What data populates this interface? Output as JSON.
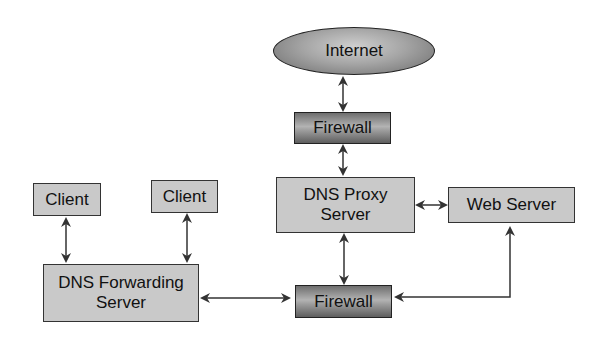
{
  "diagram": {
    "type": "network-topology",
    "nodes": {
      "internet": {
        "label": "Internet"
      },
      "firewall_top": {
        "label": "Firewall"
      },
      "dns_proxy": {
        "label": "DNS Proxy\nServer"
      },
      "web_server": {
        "label": "Web Server"
      },
      "client_left": {
        "label": "Client"
      },
      "client_right": {
        "label": "Client"
      },
      "dns_forwarding": {
        "label": "DNS Forwarding\nServer"
      },
      "firewall_bottom": {
        "label": "Firewall"
      }
    },
    "edges": [
      {
        "from": "internet",
        "to": "firewall_top",
        "direction": "both"
      },
      {
        "from": "firewall_top",
        "to": "dns_proxy",
        "direction": "both"
      },
      {
        "from": "dns_proxy",
        "to": "web_server",
        "direction": "both"
      },
      {
        "from": "dns_proxy",
        "to": "firewall_bottom",
        "direction": "both"
      },
      {
        "from": "client_left",
        "to": "dns_forwarding",
        "direction": "both"
      },
      {
        "from": "client_right",
        "to": "dns_forwarding",
        "direction": "both"
      },
      {
        "from": "dns_forwarding",
        "to": "firewall_bottom",
        "direction": "both"
      },
      {
        "from": "firewall_bottom",
        "to": "web_server",
        "direction": "both"
      }
    ],
    "colors": {
      "box_fill": "#c9c9c9",
      "firewall_fill": "#8a8a8a",
      "stroke": "#333333"
    }
  }
}
